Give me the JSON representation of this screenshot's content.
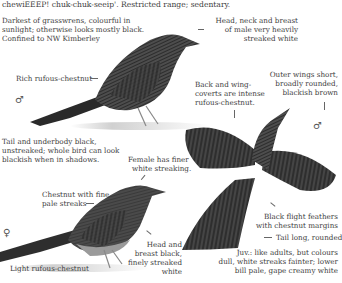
{
  "header": {
    "call_line": "chewiEEEP! chuk-chuk-seeip'. Restricted range; sedentary."
  },
  "species_notes": {
    "intro": [
      "Darkest of grasswrens, colourful in",
      "sunlight; otherwise looks mostly black.",
      "Confined to NW Kimberley"
    ]
  },
  "male_perched": {
    "sex_symbol": "♂",
    "labels": {
      "head_neck_breast": [
        "Head, neck and breast",
        "of male very heavily",
        "streaked white"
      ],
      "rich_rufous": [
        "Rich rufous-chestnut"
      ],
      "tail_underbody": [
        "Tail and underbody black,",
        "unstreaked; whole bird can look",
        "blackish when in shadows."
      ]
    }
  },
  "male_flight": {
    "sex_symbol": "♂",
    "labels": {
      "back_wing_coverts": [
        "Back and wing-",
        "coverts are intense",
        "rufous-chestnut."
      ],
      "outer_wings": [
        "Outer wings short,",
        "broadly rounded,",
        "blackish brown"
      ],
      "flight_feathers": [
        "Black flight feathers",
        "with chestnut margins"
      ],
      "tail": [
        "Tail long, rounded"
      ]
    }
  },
  "female": {
    "sex_symbol": "♀",
    "labels": {
      "finer_streaking": [
        "Female has finer",
        "white streaking."
      ],
      "chestnut_streaks": [
        "Chestnut with fine",
        "pale streaks"
      ],
      "head_breast": [
        "Head and",
        "breast black,",
        "finely streaked",
        "white"
      ],
      "light_rufous": [
        "Light rufous-chestnut"
      ]
    }
  },
  "juvenile": {
    "labels": [
      "Juv.: like adults, but colours",
      "dull, white streaks fainter; lower",
      "bill pale, gape creamy white"
    ]
  },
  "colors": {
    "ink": "#3c3c3c",
    "bird_dark": "#2a2a2a",
    "bird_mid": "#5a5a5a",
    "ground": "#d8d8d8"
  }
}
